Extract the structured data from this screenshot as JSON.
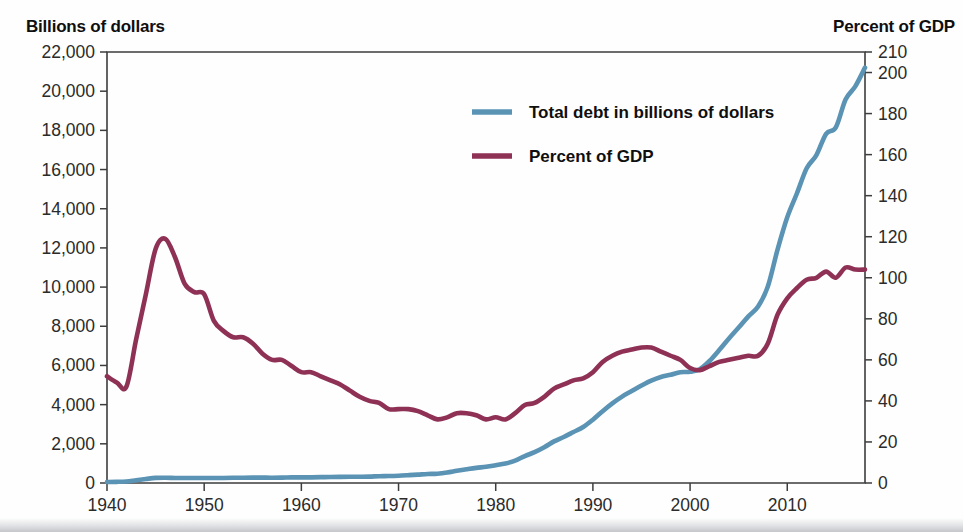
{
  "axis_titles": {
    "left": "Billions of dollars",
    "right": "Percent of GDP"
  },
  "colors": {
    "debt_line": "#5a93b4",
    "gdp_line": "#8e3155",
    "axis": "#3d3d3d",
    "text": "#0f0f0f",
    "background": "#fefefe"
  },
  "chart_data": {
    "type": "line",
    "title": "",
    "xlabel": "",
    "ylabel": "Billions of dollars",
    "y2label": "Percent of GDP",
    "grid": false,
    "legend_position": "upper-center",
    "xlim": [
      1940,
      2018
    ],
    "ylim": [
      0,
      22000
    ],
    "y2lim": [
      0,
      210
    ],
    "xticks": [
      1940,
      1950,
      1960,
      1970,
      1980,
      1990,
      2000,
      2010
    ],
    "xticklabels": [
      "1940",
      "1950",
      "1960",
      "1970",
      "1980",
      "1990",
      "2000",
      "2010"
    ],
    "yticks": [
      0,
      2000,
      4000,
      6000,
      8000,
      10000,
      12000,
      14000,
      16000,
      18000,
      20000,
      22000
    ],
    "yticklabels": [
      "0",
      "2,000",
      "4,000",
      "6,000",
      "8,000",
      "10,000",
      "12,000",
      "14,000",
      "16,000",
      "18,000",
      "20,000",
      "22,000"
    ],
    "y2ticks": [
      0,
      20,
      40,
      60,
      80,
      100,
      120,
      140,
      160,
      180,
      200,
      210
    ],
    "y2ticklabels": [
      "0",
      "20",
      "40",
      "60",
      "80",
      "100",
      "120",
      "140",
      "160",
      "180",
      "200",
      "210"
    ],
    "series": [
      {
        "name": "Total debt in billions of dollars",
        "axis": "left",
        "color": "#5a93b4",
        "x": [
          1940,
          1941,
          1942,
          1943,
          1944,
          1945,
          1946,
          1947,
          1948,
          1949,
          1950,
          1951,
          1952,
          1953,
          1954,
          1955,
          1956,
          1957,
          1958,
          1959,
          1960,
          1961,
          1962,
          1963,
          1964,
          1965,
          1966,
          1967,
          1968,
          1969,
          1970,
          1971,
          1972,
          1973,
          1974,
          1975,
          1976,
          1977,
          1978,
          1979,
          1980,
          1981,
          1982,
          1983,
          1984,
          1985,
          1986,
          1987,
          1988,
          1989,
          1990,
          1991,
          1992,
          1993,
          1994,
          1995,
          1996,
          1997,
          1998,
          1999,
          2000,
          2001,
          2002,
          2003,
          2004,
          2005,
          2006,
          2007,
          2008,
          2009,
          2010,
          2011,
          2012,
          2013,
          2014,
          2015,
          2016,
          2017,
          2018
        ],
        "values": [
          51,
          58,
          79,
          143,
          204,
          260,
          271,
          257,
          252,
          253,
          257,
          255,
          259,
          266,
          271,
          274,
          273,
          271,
          276,
          285,
          286,
          289,
          298,
          306,
          312,
          317,
          320,
          326,
          348,
          354,
          371,
          398,
          427,
          458,
          475,
          533,
          620,
          699,
          772,
          827,
          908,
          998,
          1142,
          1377,
          1572,
          1823,
          2125,
          2350,
          2602,
          2857,
          3233,
          3665,
          4065,
          4411,
          4693,
          4974,
          5225,
          5413,
          5526,
          5656,
          5674,
          5807,
          6228,
          6783,
          7379,
          7933,
          8507,
          9008,
          10025,
          11910,
          13562,
          14790,
          16066,
          16738,
          17824,
          18151,
          19573,
          20245,
          21200
        ]
      },
      {
        "name": "Percent of GDP",
        "axis": "right",
        "color": "#8e3155",
        "x": [
          1940,
          1941,
          1942,
          1943,
          1944,
          1945,
          1946,
          1947,
          1948,
          1949,
          1950,
          1951,
          1952,
          1953,
          1954,
          1955,
          1956,
          1957,
          1958,
          1959,
          1960,
          1961,
          1962,
          1963,
          1964,
          1965,
          1966,
          1967,
          1968,
          1969,
          1970,
          1971,
          1972,
          1973,
          1974,
          1975,
          1976,
          1977,
          1978,
          1979,
          1980,
          1981,
          1982,
          1983,
          1984,
          1985,
          1986,
          1987,
          1988,
          1989,
          1990,
          1991,
          1992,
          1993,
          1994,
          1995,
          1996,
          1997,
          1998,
          1999,
          2000,
          2001,
          2002,
          2003,
          2004,
          2005,
          2006,
          2007,
          2008,
          2009,
          2010,
          2011,
          2012,
          2013,
          2014,
          2015,
          2016,
          2017,
          2018
        ],
        "values": [
          52,
          49,
          47,
          70,
          92,
          114,
          119,
          110,
          97,
          93,
          92,
          79,
          74,
          71,
          71,
          68,
          63,
          60,
          60,
          57,
          54,
          54,
          52,
          50,
          48,
          45,
          42,
          40,
          39,
          36,
          36,
          36,
          35,
          33,
          31,
          32,
          34,
          34,
          33,
          31,
          32,
          31,
          34,
          38,
          39,
          42,
          46,
          48,
          50,
          51,
          54,
          59,
          62,
          64,
          65,
          66,
          66,
          64,
          62,
          60,
          56,
          55,
          57,
          59,
          60,
          61,
          62,
          62,
          68,
          82,
          90,
          95,
          99,
          100,
          103,
          100,
          105,
          104,
          104
        ]
      }
    ]
  },
  "legend": {
    "entries": [
      {
        "label": "Total debt in billions of dollars",
        "color": "#5a93b4"
      },
      {
        "label": "Percent of GDP",
        "color": "#8e3155"
      }
    ]
  }
}
